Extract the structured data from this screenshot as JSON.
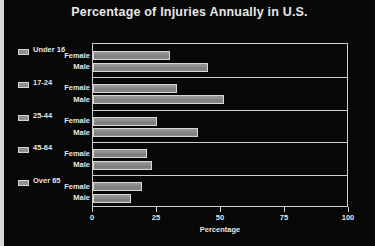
{
  "chart_data": {
    "type": "bar",
    "orientation": "horizontal",
    "title": "Percentage of Injuries Annually in U.S.",
    "xlabel": "Percentage",
    "ylabel": "",
    "xlim": [
      0,
      100
    ],
    "xticks": [
      0,
      25,
      50,
      75,
      100
    ],
    "xtick_labels": [
      "0",
      "25",
      "50",
      "75",
      "100"
    ],
    "grid": false,
    "legend": "left-group-labels",
    "categories": [
      "Under 16",
      "17-24",
      "25-44",
      "45-64",
      "Over 65"
    ],
    "series": [
      {
        "name": "Female",
        "values": [
          30,
          33,
          25,
          21,
          19
        ]
      },
      {
        "name": "Male",
        "values": [
          45,
          51,
          41,
          23,
          15
        ]
      }
    ],
    "groups": [
      {
        "label": "Under 16",
        "bars": [
          {
            "label": "Female",
            "value": 30
          },
          {
            "label": "Male",
            "value": 45
          }
        ]
      },
      {
        "label": "17-24",
        "bars": [
          {
            "label": "Female",
            "value": 33
          },
          {
            "label": "Male",
            "value": 51
          }
        ]
      },
      {
        "label": "25-44",
        "bars": [
          {
            "label": "Female",
            "value": 25
          },
          {
            "label": "Male",
            "value": 41
          }
        ]
      },
      {
        "label": "45-64",
        "bars": [
          {
            "label": "Female",
            "value": 21
          },
          {
            "label": "Male",
            "value": 23
          }
        ]
      },
      {
        "label": "Over 65",
        "bars": [
          {
            "label": "Female",
            "value": 19
          },
          {
            "label": "Male",
            "value": 15
          }
        ]
      }
    ],
    "colors": {
      "background": "#070707",
      "bar_fill": "#8a8a8a",
      "bar_edge": "#d5d5d5",
      "text": "#e6e6e6",
      "axis": "#cfcfcf",
      "border_accent": "#d8d8d8"
    }
  }
}
